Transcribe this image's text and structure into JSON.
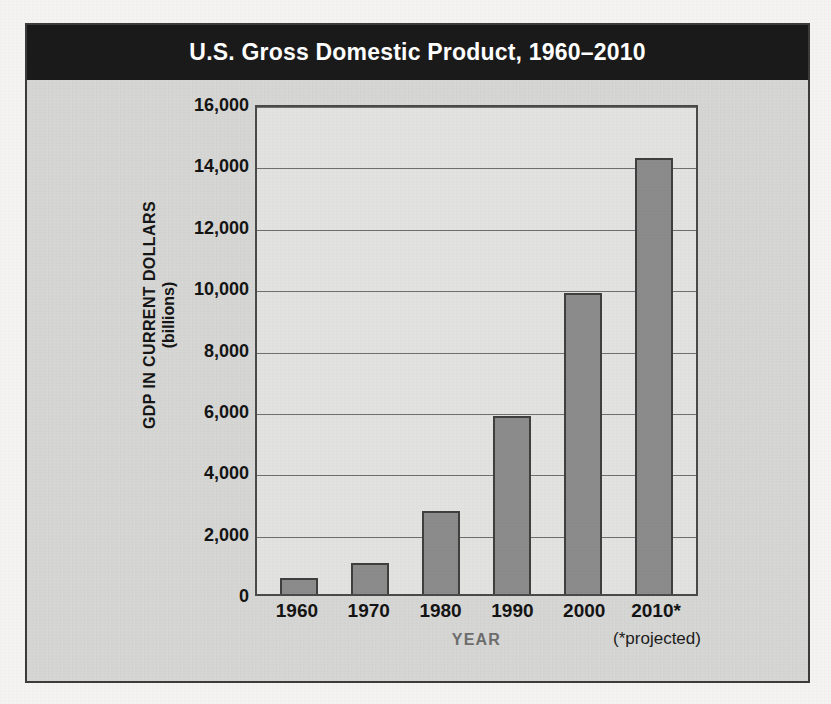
{
  "figure": {
    "title": "U.S. Gross Domestic Product, 1960–2010",
    "x_axis_title": "YEAR",
    "y_axis_title_line1": "GDP IN CURRENT DOLLARS",
    "y_axis_title_line2": "(billions)",
    "footnote": "(*projected)",
    "colors": {
      "banner_background": "#1a1a1a",
      "banner_text": "#ffffff",
      "figure_background": "#d7d7d5",
      "plot_background": "#e2e2e0",
      "bar_fill": "#8b8b8b",
      "bar_edge": "#3f3f3f",
      "gridline": "#6f6f6f",
      "axis_text": "#141414",
      "x_axis_title_text": "#6d6d6d"
    }
  },
  "chart_data": {
    "type": "bar",
    "title": "U.S. Gross Domestic Product, 1960–2010",
    "xlabel": "YEAR",
    "ylabel": "GDP IN CURRENT DOLLARS (billions)",
    "categories": [
      "1960",
      "1970",
      "1980",
      "1990",
      "2000",
      "2010*"
    ],
    "values": [
      520,
      1000,
      2720,
      5800,
      9800,
      14200
    ],
    "ylim": [
      0,
      16000
    ],
    "ytick_values": [
      0,
      2000,
      4000,
      6000,
      8000,
      10000,
      12000,
      14000,
      16000
    ],
    "ytick_labels": [
      "0",
      "2,000",
      "4,000",
      "6,000",
      "8,000",
      "10,000",
      "12,000",
      "14,000",
      "16,000"
    ],
    "grid": true,
    "legend": null,
    "annotations": [
      "(*projected)"
    ],
    "units": "billions of current dollars"
  }
}
